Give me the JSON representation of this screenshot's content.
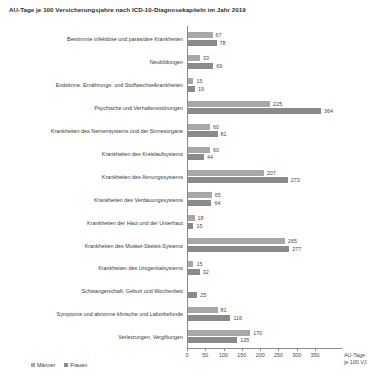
{
  "chart_data": {
    "type": "bar",
    "orientation": "horizontal",
    "title": "AU-Tage je 100 Versicherungsjahre nach ICD-10-Diagnosekapiteln im Jahr 2019",
    "xlabel": "AU-Tage",
    "xlabel_line2": "je 100 VJ",
    "ylabel": "",
    "xlim": [
      0,
      364
    ],
    "grid": false,
    "legend_position": "bottom-left",
    "axis_ticks": [
      0,
      50,
      100,
      150,
      200,
      250,
      300,
      350
    ],
    "axis_tick_labels": [
      "0",
      "50",
      "100",
      "150",
      "200",
      "250",
      "300",
      "350"
    ],
    "categories": [
      "Bestimmte infektiöse und parasitäre Krankheiten",
      "Neubildungen",
      "Endokrine, Ernährungs- und Stoffwechselkrankheiten",
      "Psychische und Verhaltensstörungen",
      "Krankheiten des Nervensystems und der Sinnesorgane",
      "Krankheiten des Kreislaufsystems",
      "Krankheiten des Atmungssystems",
      "Krankheiten des Verdauungssystems",
      "Krankheiten der Haut und der Unterhaut",
      "Krankheiten des Muskel-Skelett-Systems",
      "Krankheiten des Urogenitalsystems",
      "Schwangerschaft, Geburt und Wochenbett",
      "Symptome und abnorme klinische und Laborbefunde",
      "Verletzungen, Vergiftungen"
    ],
    "series": [
      {
        "name": "Männer",
        "color": "#a8a8a8",
        "values": [
          67,
          33,
          15,
          225,
          60,
          60,
          207,
          65,
          18,
          265,
          15,
          null,
          81,
          170
        ]
      },
      {
        "name": "Frauen",
        "color": "#8a8a8a",
        "values": [
          78,
          69,
          19,
          364,
          81,
          44,
          273,
          64,
          15,
          277,
          32,
          25,
          116,
          135
        ]
      }
    ]
  },
  "legend": {
    "items": [
      {
        "label": "Männer",
        "key": "maenner"
      },
      {
        "label": "Frauen",
        "key": "frauen"
      }
    ]
  }
}
